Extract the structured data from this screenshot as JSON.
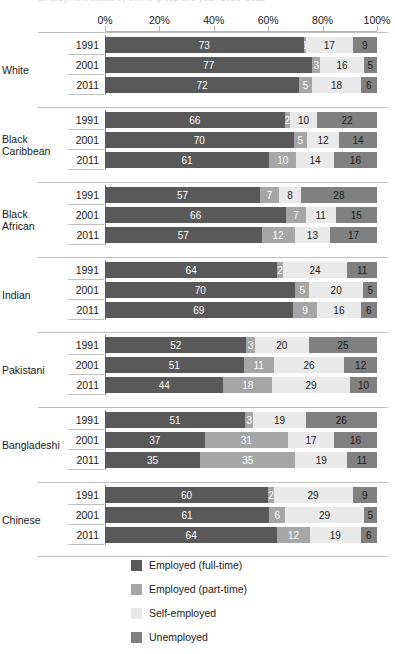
{
  "title_remnant": "Employment status by ethnic group and year, 1991–2011",
  "axis": {
    "tick_labels": [
      "0%",
      "20%",
      "40%",
      "60%",
      "80%",
      "100%"
    ],
    "min": 0,
    "max": 100,
    "grid": false
  },
  "legend": {
    "position": "bottom-center",
    "items": [
      {
        "label": "Employed (full-time)",
        "color": "#595959"
      },
      {
        "label": "Employed (part-time)",
        "color": "#a6a6a6"
      },
      {
        "label": "Self-employed",
        "color": "#e9e9e9"
      },
      {
        "label": "Unemployed",
        "color": "#808080"
      }
    ]
  },
  "chart_data": {
    "type": "bar",
    "orientation": "horizontal",
    "stacked": true,
    "title": "Employment status by ethnic group and year, 1991–2011",
    "xlabel": "",
    "ylabel": "",
    "xlim": [
      0,
      100
    ],
    "grid": false,
    "legend_position": "bottom-center",
    "series_names": [
      "Employed (full-time)",
      "Employed (part-time)",
      "Self-employed",
      "Unemployed"
    ],
    "series_colors": [
      "#595959",
      "#a6a6a6",
      "#e9e9e9",
      "#808080"
    ],
    "years": [
      "1991",
      "2001",
      "2011"
    ],
    "categories": [
      "White",
      "Black Caribbean",
      "Black African",
      "Indian",
      "Pakistani",
      "Bangladeshi",
      "Chinese"
    ],
    "groups": [
      {
        "label": "White",
        "label_lines": [
          "White"
        ],
        "rows": [
          {
            "year": "1991",
            "values": [
              73,
              1,
              17,
              9
            ]
          },
          {
            "year": "2001",
            "values": [
              77,
              3,
              16,
              5
            ]
          },
          {
            "year": "2011",
            "values": [
              72,
              5,
              18,
              6
            ]
          }
        ]
      },
      {
        "label": "Black Caribbean",
        "label_lines": [
          "Black",
          "Caribbean"
        ],
        "rows": [
          {
            "year": "1991",
            "values": [
              66,
              2,
              10,
              22
            ]
          },
          {
            "year": "2001",
            "values": [
              70,
              5,
              12,
              14
            ]
          },
          {
            "year": "2011",
            "values": [
              61,
              10,
              14,
              16
            ]
          }
        ]
      },
      {
        "label": "Black African",
        "label_lines": [
          "Black",
          "African"
        ],
        "rows": [
          {
            "year": "1991",
            "values": [
              57,
              7,
              8,
              28
            ]
          },
          {
            "year": "2001",
            "values": [
              66,
              7,
              11,
              15
            ]
          },
          {
            "year": "2011",
            "values": [
              57,
              12,
              13,
              17
            ]
          }
        ]
      },
      {
        "label": "Indian",
        "label_lines": [
          "Indian"
        ],
        "rows": [
          {
            "year": "1991",
            "values": [
              64,
              2,
              24,
              11
            ]
          },
          {
            "year": "2001",
            "values": [
              70,
              5,
              20,
              5
            ]
          },
          {
            "year": "2011",
            "values": [
              69,
              9,
              16,
              6
            ]
          }
        ]
      },
      {
        "label": "Pakistani",
        "label_lines": [
          "Pakistani"
        ],
        "rows": [
          {
            "year": "1991",
            "values": [
              52,
              3,
              20,
              25
            ]
          },
          {
            "year": "2001",
            "values": [
              51,
              11,
              26,
              12
            ]
          },
          {
            "year": "2011",
            "values": [
              44,
              18,
              29,
              10
            ]
          }
        ]
      },
      {
        "label": "Bangladeshi",
        "label_lines": [
          "Bangladeshi"
        ],
        "rows": [
          {
            "year": "1991",
            "values": [
              51,
              3,
              19,
              26
            ]
          },
          {
            "year": "2001",
            "values": [
              37,
              31,
              17,
              16
            ]
          },
          {
            "year": "2011",
            "values": [
              35,
              35,
              19,
              11
            ]
          }
        ]
      },
      {
        "label": "Chinese",
        "label_lines": [
          "Chinese"
        ],
        "rows": [
          {
            "year": "1991",
            "values": [
              60,
              2,
              29,
              9
            ]
          },
          {
            "year": "2001",
            "values": [
              61,
              6,
              29,
              5
            ]
          },
          {
            "year": "2011",
            "values": [
              64,
              12,
              19,
              6
            ]
          }
        ]
      }
    ]
  }
}
